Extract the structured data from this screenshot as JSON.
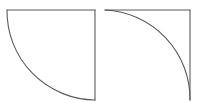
{
  "canvas": {
    "width": 201,
    "height": 111,
    "background_color": "#ffffff"
  },
  "style": {
    "stroke_color": "#5a5a5a",
    "stroke_width": 1.1,
    "fill": "none"
  },
  "figures": [
    {
      "id": "left-figure",
      "name": "concave-quarter-arc-region",
      "description": "Square corner formed by a top horizontal edge and a right vertical edge, closed by a concave circular arc sweeping from the top-left corner down to the bottom-right corner.",
      "corner_orientation": "top-right",
      "arc_concavity": "concave",
      "box": {
        "left": 7,
        "top": 10,
        "right": 95,
        "bottom": 100
      },
      "edges": [
        {
          "name": "top-edge",
          "from": [
            7,
            10
          ],
          "to": [
            95,
            10
          ]
        },
        {
          "name": "right-edge",
          "from": [
            95,
            10
          ],
          "to": [
            95,
            100
          ]
        }
      ],
      "arc": {
        "name": "concave-arc",
        "start": [
          7,
          10
        ],
        "end": [
          95,
          100
        ],
        "center": [
          95,
          10
        ],
        "radius": 89,
        "sweep": "clockwise",
        "angle_degrees": 90
      }
    },
    {
      "id": "right-figure",
      "name": "convex-quarter-arc-region",
      "description": "Square corner formed by a top horizontal edge and a right vertical edge, with a convex circular arc bulging toward the top-left, running from the top-left corner to the bottom-right corner.",
      "corner_orientation": "top-right",
      "arc_concavity": "convex",
      "box": {
        "left": 105,
        "top": 10,
        "right": 190,
        "bottom": 100
      },
      "edges": [
        {
          "name": "top-edge",
          "from": [
            105,
            10
          ],
          "to": [
            190,
            10
          ]
        },
        {
          "name": "right-edge",
          "from": [
            190,
            10
          ],
          "to": [
            190,
            100
          ]
        }
      ],
      "arc": {
        "name": "convex-arc",
        "start": [
          105,
          10
        ],
        "end": [
          190,
          100
        ],
        "center": [
          105,
          100
        ],
        "radius": 89,
        "sweep": "counter-clockwise",
        "angle_degrees": 90
      }
    }
  ]
}
